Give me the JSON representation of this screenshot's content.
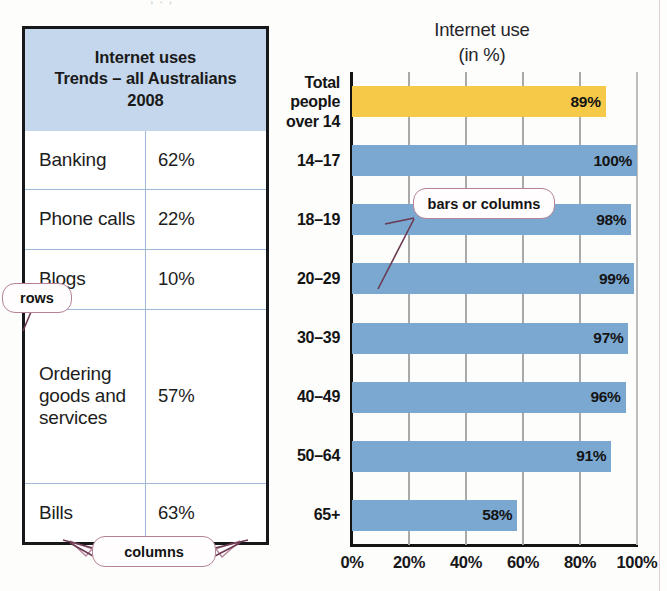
{
  "page": {
    "top_fragment": ", . ;"
  },
  "table": {
    "title": "Internet uses\nTrends – all Australians\n2008",
    "title_lines": [
      "Internet uses",
      "Trends – all Australians",
      "2008"
    ],
    "rows": [
      {
        "label": "Banking",
        "value": "62%"
      },
      {
        "label": "Phone calls",
        "value": "22%"
      },
      {
        "label": "Blogs",
        "value": "10%"
      },
      {
        "label": "Ordering goods and services",
        "value": "57%"
      },
      {
        "label": "Bills",
        "value": "63%"
      }
    ]
  },
  "annotations": {
    "rows": "rows",
    "columns": "columns",
    "bars": "bars or columns"
  },
  "colors": {
    "header_fill": "#c5d7ec",
    "bar_blue": "#7ba8d1",
    "bar_gold": "#f7c949",
    "callout_border": "#b58298",
    "grid": "#a9a9a9",
    "axis": "#141414"
  },
  "chart_data": {
    "type": "bar",
    "orientation": "horizontal",
    "title": "Internet use",
    "subtitle": "(in %)",
    "xlabel": "",
    "ylabel": "",
    "xlim": [
      0,
      100
    ],
    "xticks": [
      0,
      20,
      40,
      60,
      80,
      100
    ],
    "xtick_labels": [
      "0%",
      "20%",
      "40%",
      "60%",
      "80%",
      "100%"
    ],
    "grid": true,
    "legend": "none",
    "categories": [
      "Total\npeople\nover 14",
      "14–17",
      "18–19",
      "20–29",
      "30–39",
      "40–49",
      "50–64",
      "65+"
    ],
    "values": [
      89,
      100,
      98,
      99,
      97,
      96,
      91,
      58
    ],
    "data_labels": [
      "89%",
      "100%",
      "98%",
      "99%",
      "97%",
      "96%",
      "91%",
      "58%"
    ],
    "bar_colors": [
      "#f7c949",
      "#7ba8d1",
      "#7ba8d1",
      "#7ba8d1",
      "#7ba8d1",
      "#7ba8d1",
      "#7ba8d1",
      "#7ba8d1"
    ]
  }
}
